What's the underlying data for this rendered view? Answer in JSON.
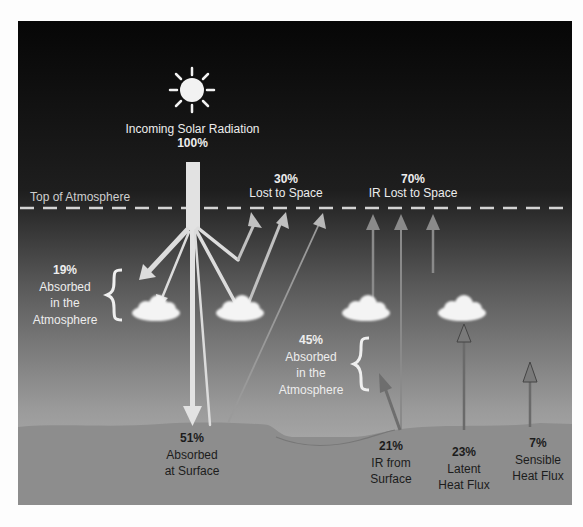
{
  "diagram": {
    "colors": {
      "space_top": "#080808",
      "atmosphere_bottom": "#b4b4b4",
      "ground": "#8c8c8c",
      "solar_beam": "#e0e0e0",
      "ir_arrow": "#7a7a7a",
      "cloud": "#f4f4f4",
      "dash_line": "#d8d8d8"
    },
    "labels": {
      "incoming": {
        "title": "Incoming Solar Radiation",
        "value": "100%"
      },
      "top_of_atmosphere": "Top of Atmosphere",
      "lost_to_space": {
        "value": "30%",
        "text": "Lost to Space"
      },
      "ir_lost_to_space": {
        "value": "70%",
        "text": "IR Lost to Space"
      },
      "absorbed_atmosphere_19": {
        "value": "19%",
        "line1": "Absorbed",
        "line2": "in the",
        "line3": "Atmosphere"
      },
      "absorbed_atmosphere_45": {
        "value": "45%",
        "line1": "Absorbed",
        "line2": "in the",
        "line3": "Atmosphere"
      },
      "absorbed_surface": {
        "value": "51%",
        "line1": "Absorbed",
        "line2": "at Surface"
      },
      "ir_from_surface": {
        "value": "21%",
        "line1": "IR from",
        "line2": "Surface"
      },
      "latent_heat": {
        "value": "23%",
        "line1": "Latent",
        "line2": "Heat Flux"
      },
      "sensible_heat": {
        "value": "7%",
        "line1": "Sensible",
        "line2": "Heat Flux"
      }
    },
    "icons": {
      "sun": "sun-icon",
      "cloud": "cloud-icon",
      "brace": "left-brace-icon"
    }
  }
}
